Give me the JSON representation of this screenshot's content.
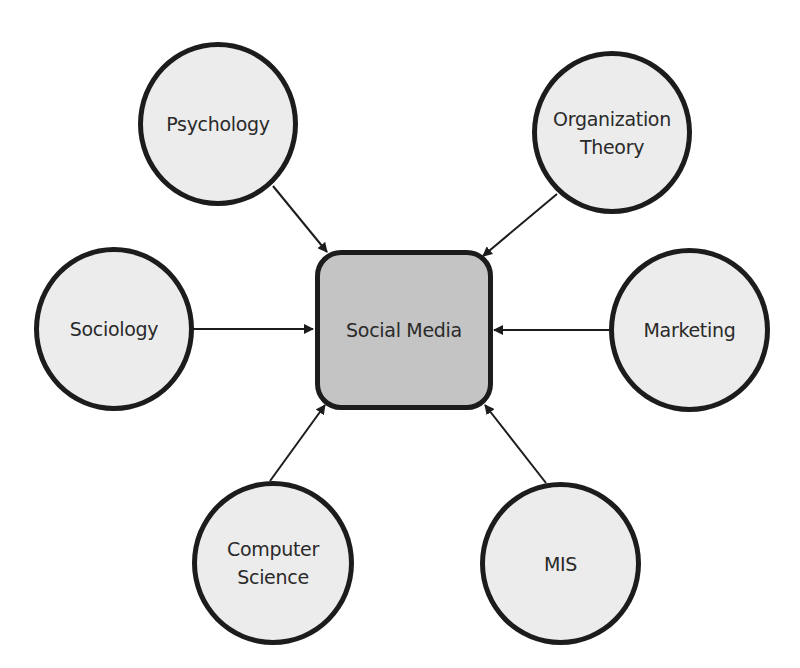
{
  "diagram": {
    "type": "hub-and-spoke",
    "center": {
      "label": "Social Media",
      "fill": "#c4c4c4"
    },
    "nodes": [
      {
        "id": "psychology",
        "label": "Psychology",
        "position": "top-left"
      },
      {
        "id": "organization-theory",
        "label": "Organization\nTheory",
        "position": "top-right"
      },
      {
        "id": "sociology",
        "label": "Sociology",
        "position": "middle-left"
      },
      {
        "id": "marketing",
        "label": "Marketing",
        "position": "middle-right"
      },
      {
        "id": "computer-science",
        "label": "Computer\nScience",
        "position": "bottom-left"
      },
      {
        "id": "mis",
        "label": "MIS",
        "position": "bottom-right"
      }
    ],
    "edges": [
      {
        "from": "psychology",
        "to": "center"
      },
      {
        "from": "organization-theory",
        "to": "center"
      },
      {
        "from": "sociology",
        "to": "center"
      },
      {
        "from": "marketing",
        "to": "center"
      },
      {
        "from": "computer-science",
        "to": "center"
      },
      {
        "from": "mis",
        "to": "center"
      }
    ],
    "colors": {
      "node_fill": "#ececec",
      "center_fill": "#c4c4c4",
      "stroke": "#1c1c1c",
      "text": "#2a2a2a"
    }
  }
}
